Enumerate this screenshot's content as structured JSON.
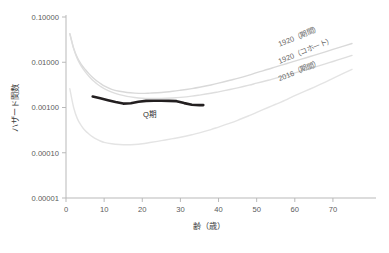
{
  "chart_data": {
    "type": "line",
    "title": "",
    "xlabel": "齢（歳）",
    "ylabel": "ハザード関数",
    "yscale": "log",
    "xlim": [
      0,
      75
    ],
    "ylim": [
      1e-05,
      0.1
    ],
    "grid": false,
    "legend_position": "inline-right",
    "xticks": [
      0,
      10,
      20,
      30,
      40,
      50,
      60,
      70
    ],
    "xtick_labels": [
      "0",
      "10",
      "20",
      "30",
      "40",
      "50",
      "60",
      "70"
    ],
    "yticks": [
      0.1,
      0.01,
      0.001,
      0.0001,
      1e-05
    ],
    "ytick_labels": [
      "0.10000",
      "0.01000",
      "0.00100",
      "0.00010",
      "0.00001"
    ],
    "annotations": [
      {
        "text": "Q期",
        "x": 22,
        "y": 0.00062
      }
    ],
    "series": [
      {
        "name": "1920（期間）",
        "color": "#d9d9d9",
        "width": 1.4,
        "label_x": 56,
        "label_y": 0.022,
        "x": [
          1,
          2,
          3,
          4,
          5,
          6,
          7,
          8,
          9,
          10,
          12,
          14,
          16,
          18,
          20,
          22,
          25,
          28,
          30,
          33,
          35,
          38,
          40,
          43,
          45,
          48,
          50,
          53,
          55,
          58,
          60,
          63,
          65,
          68,
          70,
          73,
          75
        ],
        "y": [
          0.043,
          0.0205,
          0.0125,
          0.009,
          0.007,
          0.0056,
          0.0046,
          0.0039,
          0.0034,
          0.003,
          0.00252,
          0.00228,
          0.00215,
          0.00208,
          0.00205,
          0.00208,
          0.00215,
          0.00228,
          0.0024,
          0.00262,
          0.0028,
          0.00315,
          0.00345,
          0.004,
          0.0044,
          0.0052,
          0.0059,
          0.007,
          0.0079,
          0.0094,
          0.0106,
          0.0126,
          0.0142,
          0.017,
          0.0192,
          0.023,
          0.026
        ]
      },
      {
        "name": "1920（コホート）",
        "color": "#dedede",
        "width": 1.4,
        "label_x": 56,
        "label_y": 0.0092,
        "x": [
          1,
          2,
          3,
          4,
          5,
          6,
          7,
          8,
          9,
          10,
          12,
          14,
          16,
          18,
          20,
          22,
          25,
          28,
          30,
          33,
          35,
          38,
          40,
          43,
          45,
          48,
          50,
          53,
          55,
          58,
          60,
          63,
          65,
          68,
          70,
          73,
          75
        ],
        "y": [
          0.043,
          0.02,
          0.0118,
          0.0082,
          0.0062,
          0.0049,
          0.004,
          0.0034,
          0.00295,
          0.00262,
          0.00218,
          0.00192,
          0.00176,
          0.00166,
          0.0016,
          0.00158,
          0.00158,
          0.00162,
          0.00167,
          0.00178,
          0.00188,
          0.00206,
          0.00222,
          0.0025,
          0.00272,
          0.00312,
          0.00345,
          0.004,
          0.00445,
          0.0052,
          0.0058,
          0.00685,
          0.0077,
          0.0092,
          0.0104,
          0.0125,
          0.0142
        ]
      },
      {
        "name": "2016（期間）",
        "color": "#e4e4e4",
        "width": 1.4,
        "label_x": 56,
        "label_y": 0.0038,
        "x": [
          1,
          2,
          3,
          4,
          5,
          6,
          7,
          8,
          9,
          10,
          12,
          14,
          16,
          18,
          20,
          22,
          25,
          28,
          30,
          33,
          35,
          38,
          40,
          43,
          45,
          48,
          50,
          53,
          55,
          58,
          60,
          63,
          65,
          68,
          70,
          73,
          75
        ],
        "y": [
          0.0026,
          0.001,
          0.00056,
          0.0004,
          0.00031,
          0.00026,
          0.000225,
          0.0002,
          0.000182,
          0.00017,
          0.000158,
          0.000152,
          0.00015,
          0.000152,
          0.000158,
          0.000168,
          0.000185,
          0.000205,
          0.00022,
          0.00025,
          0.000275,
          0.000325,
          0.00037,
          0.00045,
          0.00052,
          0.00066,
          0.00078,
          0.001,
          0.00118,
          0.00152,
          0.00182,
          0.00235,
          0.0028,
          0.00365,
          0.0044,
          0.0058,
          0.007
        ]
      },
      {
        "name": "Q期",
        "color": "#231f20",
        "width": 2.6,
        "is_highlight": true,
        "x": [
          7,
          9,
          11,
          13,
          15,
          17,
          19,
          21,
          23,
          25,
          27,
          29,
          31,
          33,
          35,
          36
        ],
        "y": [
          0.00175,
          0.0016,
          0.00145,
          0.00132,
          0.00122,
          0.00124,
          0.00134,
          0.0014,
          0.00141,
          0.00141,
          0.0014,
          0.00138,
          0.00125,
          0.00115,
          0.00113,
          0.00113
        ]
      }
    ]
  },
  "axes": {
    "y_axis_name": "ハザード関数",
    "x_axis_name": "齢（歳）"
  }
}
